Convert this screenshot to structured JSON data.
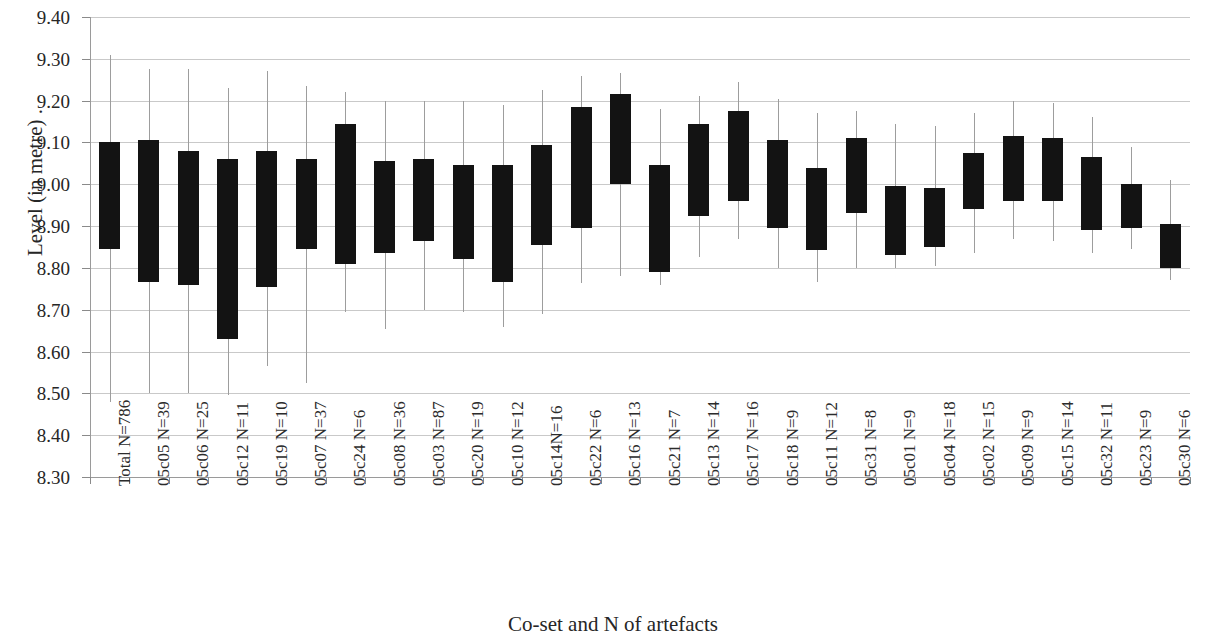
{
  "chart_data": {
    "type": "bar",
    "subtype": "floating-bar-with-range-whiskers",
    "title": "",
    "xlabel": "Co-set and N of artefacts",
    "ylabel": "Level (in metre) .",
    "ylim": [
      8.3,
      9.4
    ],
    "ytick_step": 0.1,
    "ytick_labels": [
      "9.40",
      "9.30",
      "9.20",
      "9.10",
      "9.00",
      "8.90",
      "8.80",
      "8.70",
      "8.60",
      "8.50",
      "8.40",
      "8.30"
    ],
    "ytick_values": [
      9.4,
      9.3,
      9.2,
      9.1,
      9.0,
      8.9,
      8.8,
      8.7,
      8.6,
      8.5,
      8.4,
      8.3
    ],
    "grid": true,
    "legend": "none",
    "bar_color": "#131313",
    "whisker_color": "#9d9d9d",
    "categories": [
      "Total N=786",
      "05c05 N=39",
      "05c06 N=25",
      "05c12 N=11",
      "05c19 N=10",
      "05c07 N=37",
      "05c24 N=6",
      "05c08 N=36",
      "05c03 N=87",
      "05c20 N=19",
      "05c10 N=12",
      "05c14N=16",
      "05c22 N=6",
      "05c16 N=13",
      "05c21 N=7",
      "05c13 N=14",
      "05c17 N=16",
      "05c18 N=9",
      "05c11 N=12",
      "05c31 N=8",
      "05c01 N=9",
      "05c04 N=18",
      "05c02 N=15",
      "05c09 N=9",
      "05c15 N=14",
      "05c32 N=11",
      "05c23 N=9",
      "05c30 N=6"
    ],
    "series": [
      {
        "name": "box_top",
        "values": [
          9.1,
          9.105,
          9.08,
          9.06,
          9.08,
          9.06,
          9.145,
          9.055,
          9.06,
          9.045,
          9.045,
          9.095,
          9.185,
          9.215,
          9.045,
          9.145,
          9.175,
          9.105,
          9.04,
          9.11,
          8.995,
          8.99,
          9.075,
          9.115,
          9.11,
          9.065,
          9.0,
          8.905
        ]
      },
      {
        "name": "box_bottom",
        "values": [
          8.845,
          8.765,
          8.76,
          8.63,
          8.755,
          8.845,
          8.81,
          8.835,
          8.865,
          8.82,
          8.765,
          8.855,
          8.895,
          9.0,
          8.79,
          8.925,
          8.96,
          8.895,
          8.845,
          8.93,
          8.83,
          8.85,
          8.94,
          8.96,
          8.96,
          8.89,
          8.895,
          8.8
        ]
      },
      {
        "name": "whisker_high",
        "values": [
          9.31,
          9.275,
          9.275,
          9.23,
          9.27,
          9.235,
          9.22,
          9.2,
          9.2,
          9.2,
          9.19,
          9.225,
          9.26,
          9.265,
          9.18,
          9.21,
          9.245,
          9.205,
          9.17,
          9.175,
          9.145,
          9.14,
          9.17,
          9.2,
          9.195,
          9.16,
          9.09,
          9.01
        ]
      },
      {
        "name": "whisker_low",
        "values": [
          8.48,
          8.5,
          8.5,
          8.495,
          8.565,
          8.525,
          8.695,
          8.655,
          8.7,
          8.695,
          8.66,
          8.69,
          8.765,
          8.78,
          8.76,
          8.825,
          8.87,
          8.8,
          8.765,
          8.8,
          8.8,
          8.805,
          8.835,
          8.87,
          8.865,
          8.835,
          8.845,
          8.77
        ]
      }
    ]
  }
}
